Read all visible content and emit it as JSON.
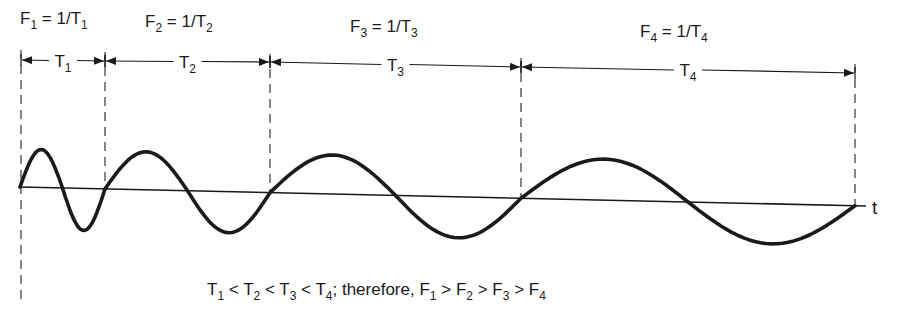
{
  "diagram": {
    "frequency_labels": [
      {
        "name": "F",
        "sub": "1",
        "eq": " = 1/T",
        "eq_sub": "1",
        "x": 20,
        "y": 24
      },
      {
        "name": "F",
        "sub": "2",
        "eq": " = 1/T",
        "eq_sub": "2",
        "x": 145,
        "y": 27
      },
      {
        "name": "F",
        "sub": "3",
        "eq": " = 1/T",
        "eq_sub": "3",
        "x": 350,
        "y": 32
      },
      {
        "name": "F",
        "sub": "4",
        "eq": " = 1/T",
        "eq_sub": "4",
        "x": 640,
        "y": 37
      }
    ],
    "periods": [
      {
        "label": "T",
        "sub": "1",
        "x_start": 21,
        "x_end": 105,
        "y_start": 60,
        "y_end": 61
      },
      {
        "label": "T",
        "sub": "2",
        "x_start": 105,
        "x_end": 270,
        "y_start": 61,
        "y_end": 62
      },
      {
        "label": "T",
        "sub": "3",
        "x_start": 270,
        "x_end": 521,
        "y_start": 62,
        "y_end": 67
      },
      {
        "label": "T",
        "sub": "4",
        "x_start": 521,
        "x_end": 855,
        "y_start": 67,
        "y_end": 73
      }
    ],
    "boundaries": [
      {
        "x": 21,
        "y_top": 50,
        "y_bottom": 305
      },
      {
        "x": 105,
        "y_top": 52,
        "y_bottom": 190
      },
      {
        "x": 270,
        "y_top": 54,
        "y_bottom": 194
      },
      {
        "x": 521,
        "y_top": 58,
        "y_bottom": 199
      },
      {
        "x": 855,
        "y_top": 64,
        "y_bottom": 206
      }
    ],
    "axis": {
      "x_start": 20,
      "y_start": 187,
      "x_end": 866,
      "y_end": 206,
      "label": "t",
      "label_x": 872,
      "label_y": 214
    },
    "cycles": [
      {
        "x0": 20,
        "x1": 105,
        "amp_peak": 38,
        "amp_trough": 42
      },
      {
        "x0": 105,
        "x1": 270,
        "amp_peak": 38,
        "amp_trough": 41
      },
      {
        "x0": 270,
        "x1": 521,
        "amp_peak": 39,
        "amp_trough": 41
      },
      {
        "x0": 521,
        "x1": 855,
        "amp_peak": 41,
        "amp_trough": 40
      }
    ],
    "caption": {
      "parts": [
        {
          "t": "T"
        },
        {
          "s": "1"
        },
        {
          "t": " < T"
        },
        {
          "s": "2"
        },
        {
          "t": " < T"
        },
        {
          "s": "3"
        },
        {
          "t": " < T"
        },
        {
          "s": "4"
        },
        {
          "t": ";  therefore, F"
        },
        {
          "s": "1"
        },
        {
          "t": " > F"
        },
        {
          "s": "2"
        },
        {
          "t": " > F"
        },
        {
          "s": "3"
        },
        {
          "t": " > F"
        },
        {
          "s": "4"
        }
      ],
      "text": "T1 < T2 < T3 < T4; therefore, F1 > F2 > F3 > F4",
      "x": 207,
      "y": 295
    },
    "colors": {
      "ink": "#1a1a1a",
      "dash": "#444444",
      "background": "#ffffff"
    }
  }
}
